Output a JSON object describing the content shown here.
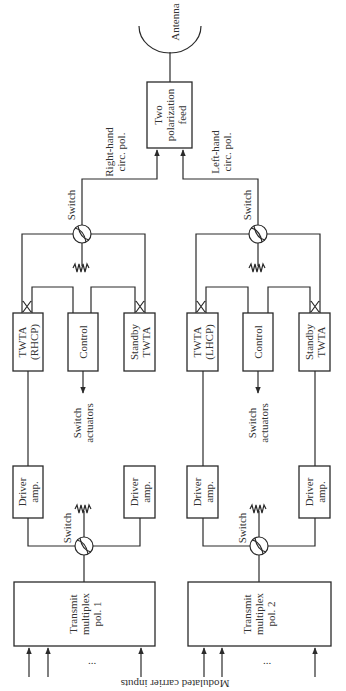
{
  "diagram": {
    "colors": {
      "line": "#2a2a2a",
      "text": "#333333",
      "background": "#ffffff"
    },
    "antenna": {
      "label": "Antenna"
    },
    "feed": {
      "label": "Two\npolarization\nfeed"
    },
    "paths": {
      "right": {
        "label": "Right-hand\ncirc. pol."
      },
      "left": {
        "label": "Left-hand\ncirc. pol."
      }
    },
    "groups": [
      {
        "id": "pol1",
        "output_switch": {
          "label": "Switch"
        },
        "twta_primary": {
          "label": "TWTA\n(RHCP)"
        },
        "control": {
          "label": "Control"
        },
        "twta_standby": {
          "label": "Standby\nTWTA"
        },
        "switch_actuators": {
          "label": "Switch\nactuators"
        },
        "driver_primary": {
          "label": "Driver\namp."
        },
        "driver_standby": {
          "label": "Driver\namp."
        },
        "input_switch": {
          "label": "Switch"
        },
        "multiplex": {
          "label": "Transmit\nmultiplex\npol. 1"
        },
        "inputs_ellipsis": "..."
      },
      {
        "id": "pol2",
        "output_switch": {
          "label": "Switch"
        },
        "twta_primary": {
          "label": "TWTA\n(LHCP)"
        },
        "control": {
          "label": "Control"
        },
        "twta_standby": {
          "label": "Standby\nTWTA"
        },
        "switch_actuators": {
          "label": "Switch\nactuators"
        },
        "driver_primary": {
          "label": "Driver\namp."
        },
        "driver_standby": {
          "label": "Driver\namp."
        },
        "input_switch": {
          "label": "Switch"
        },
        "multiplex": {
          "label": "Transmit\nmultiplex\npol. 2"
        },
        "inputs_ellipsis": "..."
      }
    ],
    "inputs_label": "Modulated carrier inputs"
  }
}
